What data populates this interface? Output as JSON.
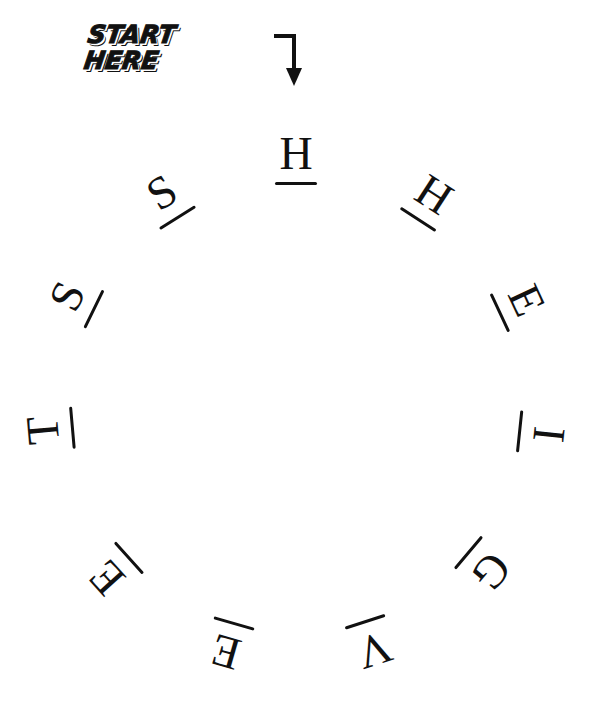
{
  "puzzle": {
    "start_label_line1": "START",
    "start_label_line2": "HERE",
    "arrow_icon": "bent-arrow-down",
    "ink_color": "#111111",
    "background_color": "#ffffff",
    "letters": [
      {
        "char": "H",
        "angle": 0
      },
      {
        "char": "H",
        "angle": 33
      },
      {
        "char": "E",
        "angle": 65
      },
      {
        "char": "I",
        "angle": 96
      },
      {
        "char": "G",
        "angle": 130
      },
      {
        "char": "V",
        "angle": 162
      },
      {
        "char": "E",
        "angle": 196
      },
      {
        "char": "E",
        "angle": 228
      },
      {
        "char": "T",
        "angle": 265
      },
      {
        "char": "S",
        "angle": 296
      },
      {
        "char": "S",
        "angle": 328
      }
    ]
  }
}
